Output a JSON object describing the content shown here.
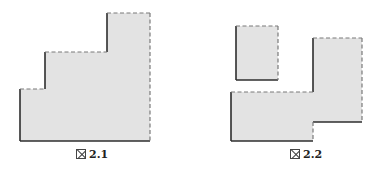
{
  "figures": [
    {
      "id": "fig-2-1",
      "caption_mark": "図",
      "caption_number": "2.1",
      "description": "Staircase-shaped gray region with three steps; left, step risers and bottom edges solid, tops and right edge dashed"
    },
    {
      "id": "fig-2-2",
      "caption_mark": "図",
      "caption_number": "2.2",
      "description": "A separate small gray rectangle above, and an L-shaped gray region below made of a wide lower block and a tall right block; left/bottom edges solid, top/right edges dashed"
    }
  ],
  "colors": {
    "fill": "#e3e3e3",
    "solid_edge": "#2e2e2e",
    "dashed_edge": "#7a7a7a"
  }
}
